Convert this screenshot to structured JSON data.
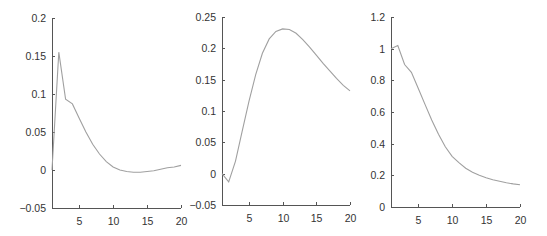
{
  "colors": {
    "line": "#a0a0a0",
    "axis": "#555555",
    "text": "#333333"
  },
  "chart_data": [
    {
      "type": "line",
      "title": "",
      "xlabel": "",
      "ylabel": "",
      "xlim": [
        1,
        20
      ],
      "ylim": [
        -0.05,
        0.2
      ],
      "grid": false,
      "xticks": [
        5,
        10,
        15,
        20
      ],
      "xtick_labels": [
        "5",
        "10",
        "15",
        "20"
      ],
      "yticks": [
        -0.05,
        0,
        0.05,
        0.1,
        0.15,
        0.2
      ],
      "ytick_labels": [
        "−0.05",
        "0",
        "0.05",
        "0.1",
        "0.15",
        "0.2"
      ],
      "x": [
        1,
        2,
        3,
        4,
        5,
        6,
        7,
        8,
        9,
        10,
        11,
        12,
        13,
        14,
        15,
        16,
        17,
        18,
        19,
        20
      ],
      "series": [
        {
          "name": "",
          "values": [
            0.0,
            0.155,
            0.093,
            0.087,
            0.068,
            0.05,
            0.034,
            0.021,
            0.011,
            0.004,
            0.0,
            -0.002,
            -0.003,
            -0.003,
            -0.002,
            -0.001,
            0.001,
            0.003,
            0.004,
            0.006
          ]
        }
      ],
      "frame": {
        "left": 52,
        "top": 18,
        "right": 181,
        "bottom": 208
      }
    },
    {
      "type": "line",
      "title": "",
      "xlabel": "",
      "ylabel": "",
      "xlim": [
        1,
        20
      ],
      "ylim": [
        -0.05,
        0.25
      ],
      "grid": false,
      "xticks": [
        5,
        10,
        15,
        20
      ],
      "xtick_labels": [
        "5",
        "10",
        "15",
        "20"
      ],
      "yticks": [
        -0.05,
        0,
        0.05,
        0.1,
        0.15,
        0.2,
        0.25
      ],
      "ytick_labels": [
        "−0.05",
        "0",
        "0.05",
        "0.1",
        "0.15",
        "0.2",
        "0.25"
      ],
      "x": [
        1,
        2,
        3,
        4,
        5,
        6,
        7,
        8,
        9,
        10,
        11,
        12,
        13,
        14,
        15,
        16,
        17,
        18,
        19,
        20
      ],
      "series": [
        {
          "name": "",
          "values": [
            0.0,
            -0.013,
            0.02,
            0.068,
            0.115,
            0.158,
            0.192,
            0.215,
            0.227,
            0.231,
            0.23,
            0.224,
            0.214,
            0.202,
            0.189,
            0.176,
            0.164,
            0.152,
            0.141,
            0.132
          ]
        }
      ],
      "frame": {
        "left": 222,
        "top": 17,
        "right": 350,
        "bottom": 205
      }
    },
    {
      "type": "line",
      "title": "",
      "xlabel": "",
      "ylabel": "",
      "xlim": [
        1,
        20
      ],
      "ylim": [
        0,
        1.2
      ],
      "grid": false,
      "xticks": [
        5,
        10,
        15,
        20
      ],
      "xtick_labels": [
        "5",
        "10",
        "15",
        "20"
      ],
      "yticks": [
        0,
        0.2,
        0.4,
        0.6,
        0.8,
        1,
        1.2
      ],
      "ytick_labels": [
        "0",
        "0.2",
        "0.4",
        "0.6",
        "0.8",
        "1",
        "1.2"
      ],
      "x": [
        1,
        2,
        3,
        4,
        5,
        6,
        7,
        8,
        9,
        10,
        11,
        12,
        13,
        14,
        15,
        16,
        17,
        18,
        19,
        20
      ],
      "series": [
        {
          "name": "",
          "values": [
            1.0,
            1.02,
            0.9,
            0.85,
            0.75,
            0.65,
            0.55,
            0.46,
            0.38,
            0.32,
            0.28,
            0.245,
            0.22,
            0.2,
            0.185,
            0.172,
            0.162,
            0.153,
            0.146,
            0.14
          ]
        }
      ],
      "frame": {
        "left": 391,
        "top": 17,
        "right": 520,
        "bottom": 207
      }
    }
  ]
}
